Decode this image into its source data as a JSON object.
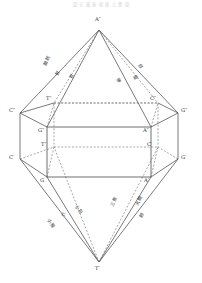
{
  "figure": {
    "header_note": "圖 五 臟 腑 經 絡 立 體 圖",
    "background": "#ffffff",
    "solid_stroke": "#4d4d4d",
    "dashed_stroke": "#6b6b6b",
    "label_color": "#2b2b2b"
  },
  "vertices": {
    "apex_top": "A″",
    "apex_bottom": "T′",
    "upper_left_outer": "C″",
    "lower_left_outer": "C′",
    "upper_right_outer": "G″",
    "lower_right_outer": "G′",
    "top_back_left": "T″",
    "top_back_right": "C″",
    "top_front_left": "G″",
    "top_front_right": "A″",
    "bottom_back_left": "T″",
    "bottom_back_right": "C′",
    "bottom_front_left": "G",
    "bottom_front_right": "A′"
  },
  "edge_labels": {
    "upper_left": [
      "膀胱",
      "腎",
      "胃"
    ],
    "upper_right": [
      "肝",
      "膽",
      "脾"
    ],
    "lower_left": [
      "心包",
      "心",
      "小腸"
    ],
    "lower_right": [
      "三焦",
      "大腸",
      "肺"
    ]
  },
  "geometry": {
    "apex_top_xy": [
      99,
      30
    ],
    "apex_bottom_xy": [
      99,
      262
    ],
    "left_outer_top_xy": [
      20,
      113
    ],
    "left_outer_bottom_xy": [
      20,
      159
    ],
    "right_outer_top_xy": [
      178,
      113
    ],
    "right_outer_bottom_xy": [
      178,
      159
    ],
    "prism_front_left_top_xy": [
      47,
      127
    ],
    "prism_front_right_top_xy": [
      151,
      127
    ],
    "prism_front_left_bottom_xy": [
      47,
      177
    ],
    "prism_front_right_bottom_xy": [
      151,
      177
    ],
    "prism_back_left_top_xy": [
      54,
      103
    ],
    "prism_back_right_top_xy": [
      158,
      103
    ],
    "prism_back_left_bottom_xy": [
      54,
      147
    ],
    "prism_back_right_bottom_xy": [
      158,
      147
    ]
  }
}
